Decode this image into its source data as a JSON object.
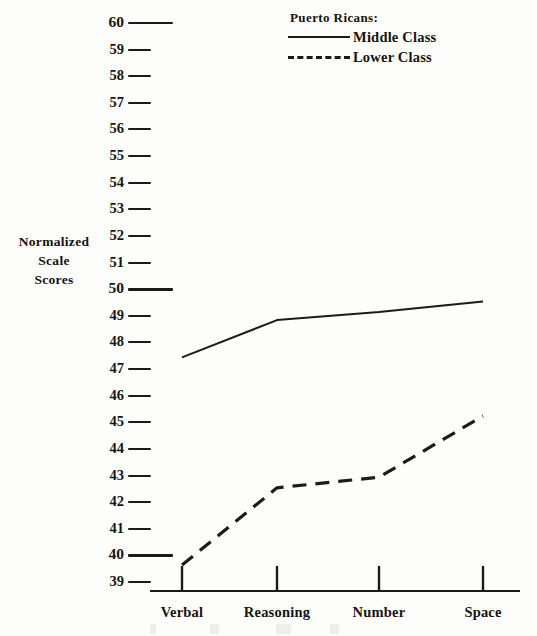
{
  "chart_data": {
    "type": "line",
    "title": "",
    "xlabel": "",
    "ylabel": "Normalized Scale Scores",
    "categories": [
      "Verbal",
      "Reasoning",
      "Number",
      "Space"
    ],
    "ylim": [
      38.5,
      60.5
    ],
    "ytick_labels": [
      "60",
      "59",
      "58",
      "57",
      "56",
      "55",
      "54",
      "53",
      "52",
      "51",
      "50",
      "49",
      "48",
      "47",
      "46",
      "45",
      "44",
      "43",
      "42",
      "41",
      "40",
      "39"
    ],
    "ytick_values": [
      60,
      59,
      58,
      57,
      56,
      55,
      54,
      53,
      52,
      51,
      50,
      49,
      48,
      47,
      46,
      45,
      44,
      43,
      42,
      41,
      40,
      39
    ],
    "ytick_major": [
      60,
      50,
      40
    ],
    "grid": false,
    "legend_position": "top-right",
    "series": [
      {
        "name": "Middle Class",
        "style": "solid",
        "color": "#1d1b18",
        "values": [
          47.4,
          48.8,
          49.1,
          49.5
        ]
      },
      {
        "name": "Lower Class",
        "style": "dashed",
        "color": "#1d1b18",
        "values": [
          39.6,
          42.5,
          42.9,
          45.2
        ]
      }
    ]
  },
  "y_axis": {
    "title_lines": [
      "Normalized",
      "Scale",
      "Scores"
    ]
  },
  "legend": {
    "title": "Puerto Ricans:",
    "entries": [
      {
        "label": "Middle Class",
        "style": "solid"
      },
      {
        "label": "Lower Class",
        "style": "dashed"
      }
    ]
  },
  "colors": {
    "ink": "#1d1b18",
    "paper": "#fdfdfc"
  }
}
